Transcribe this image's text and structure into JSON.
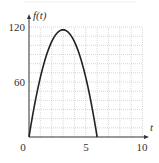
{
  "chart_data": {
    "type": "line",
    "title": "",
    "xlabel": "t",
    "ylabel": "f(t)",
    "xlim": [
      0,
      10
    ],
    "ylim": [
      0,
      120
    ],
    "x_ticks": [
      "0",
      "5",
      "10"
    ],
    "y_ticks": [
      "60",
      "120"
    ],
    "grid": true,
    "grid_spacing": {
      "x": 1,
      "y": 10
    },
    "series": [
      {
        "name": "f(t)",
        "x": [
          0,
          0.5,
          1,
          1.5,
          2,
          2.5,
          3,
          3.5,
          4,
          4.5,
          5,
          5.5,
          6
        ],
        "values": [
          0,
          35.8,
          65,
          87.8,
          104,
          113.8,
          117,
          113.8,
          104,
          87.8,
          65,
          35.8,
          0
        ]
      }
    ]
  },
  "labels": {
    "y_axis": "f(t)",
    "x_axis": "t",
    "x_tick_0": "0",
    "x_tick_5": "5",
    "x_tick_10": "10",
    "y_tick_60": "60",
    "y_tick_120": "120"
  }
}
